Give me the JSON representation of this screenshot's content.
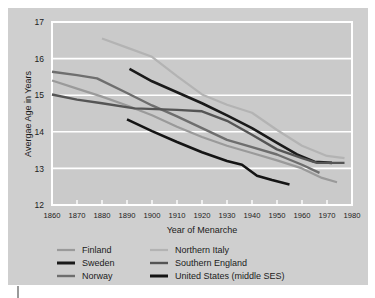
{
  "chart_data": {
    "type": "line",
    "title": "",
    "xlabel": "Year of Menarche",
    "ylabel": "Avergae Age in Years",
    "xlim": [
      1860,
      1980
    ],
    "ylim": [
      12,
      17
    ],
    "xticks": [
      1860,
      1870,
      1880,
      1890,
      1900,
      1910,
      1920,
      1930,
      1940,
      1950,
      1960,
      1970,
      1980
    ],
    "yticks": [
      12,
      13,
      14,
      15,
      16,
      17
    ],
    "xtick_labels": [
      "1860",
      "1870",
      "1880",
      "1890",
      "1900",
      "1910",
      "1920",
      "1930",
      "1940",
      "1950",
      "1960",
      "1970",
      "1980"
    ],
    "ytick_labels": [
      "12",
      "13",
      "14",
      "15",
      "16",
      "17"
    ],
    "grid": true,
    "legend_position": "below",
    "background_color": "#cfcfcf",
    "gridline_color": "#ffffff",
    "series": [
      {
        "name": "Finland",
        "color": "#9a9a9a",
        "width": 2.2,
        "points": [
          [
            1860,
            15.4
          ],
          [
            1870,
            15.18
          ],
          [
            1880,
            14.96
          ],
          [
            1890,
            14.72
          ],
          [
            1900,
            14.45
          ],
          [
            1910,
            14.14
          ],
          [
            1920,
            13.86
          ],
          [
            1930,
            13.62
          ],
          [
            1940,
            13.42
          ],
          [
            1950,
            13.22
          ],
          [
            1960,
            13.0
          ],
          [
            1968,
            12.74
          ],
          [
            1974,
            12.62
          ]
        ]
      },
      {
        "name": "Sweden",
        "color": "#1a1a1a",
        "width": 2.6,
        "points": [
          [
            1891,
            15.72
          ],
          [
            1900,
            15.38
          ],
          [
            1910,
            15.08
          ],
          [
            1920,
            14.78
          ],
          [
            1930,
            14.45
          ],
          [
            1940,
            14.1
          ],
          [
            1950,
            13.7
          ],
          [
            1958,
            13.38
          ],
          [
            1965,
            13.18
          ],
          [
            1972,
            13.15
          ]
        ]
      },
      {
        "name": "Norway",
        "color": "#6e6e6e",
        "width": 2.4,
        "points": [
          [
            1860,
            15.64
          ],
          [
            1870,
            15.55
          ],
          [
            1878,
            15.46
          ],
          [
            1890,
            15.06
          ],
          [
            1900,
            14.72
          ],
          [
            1910,
            14.42
          ],
          [
            1920,
            14.1
          ],
          [
            1930,
            13.78
          ],
          [
            1940,
            13.58
          ],
          [
            1950,
            13.38
          ],
          [
            1960,
            13.1
          ],
          [
            1967,
            12.88
          ]
        ]
      },
      {
        "name": "Northern Italy",
        "color": "#b3b3b3",
        "width": 2.2,
        "points": [
          [
            1880,
            16.55
          ],
          [
            1890,
            16.3
          ],
          [
            1900,
            16.05
          ],
          [
            1910,
            15.52
          ],
          [
            1920,
            15.02
          ],
          [
            1930,
            14.74
          ],
          [
            1940,
            14.52
          ],
          [
            1950,
            14.05
          ],
          [
            1960,
            13.62
          ],
          [
            1970,
            13.34
          ],
          [
            1977,
            13.28
          ]
        ]
      },
      {
        "name": "Southern England",
        "color": "#555555",
        "width": 2.4,
        "points": [
          [
            1860,
            15.02
          ],
          [
            1870,
            14.88
          ],
          [
            1880,
            14.78
          ],
          [
            1893,
            14.64
          ],
          [
            1910,
            14.6
          ],
          [
            1920,
            14.56
          ],
          [
            1930,
            14.3
          ],
          [
            1940,
            13.92
          ],
          [
            1950,
            13.52
          ],
          [
            1960,
            13.28
          ],
          [
            1966,
            13.15
          ],
          [
            1977,
            13.15
          ]
        ]
      },
      {
        "name": "United States (middle SES)",
        "color": "#141414",
        "width": 2.6,
        "points": [
          [
            1890,
            14.34
          ],
          [
            1900,
            14.02
          ],
          [
            1910,
            13.72
          ],
          [
            1920,
            13.44
          ],
          [
            1930,
            13.2
          ],
          [
            1936,
            13.1
          ],
          [
            1942,
            12.8
          ],
          [
            1948,
            12.68
          ],
          [
            1955,
            12.56
          ]
        ]
      }
    ],
    "legend": [
      {
        "label": "Finland",
        "color": "#9a9a9a",
        "width": 2.2,
        "column": 0,
        "row": 0
      },
      {
        "label": "Sweden",
        "color": "#1a1a1a",
        "width": 3.0,
        "column": 0,
        "row": 1
      },
      {
        "label": "Norway",
        "color": "#6e6e6e",
        "width": 2.4,
        "column": 0,
        "row": 2
      },
      {
        "label": "Northern Italy",
        "color": "#b3b3b3",
        "width": 2.2,
        "column": 1,
        "row": 0
      },
      {
        "label": "Southern England",
        "color": "#555555",
        "width": 2.4,
        "column": 1,
        "row": 1
      },
      {
        "label": "United States (middle SES)",
        "color": "#141414",
        "width": 3.0,
        "column": 1,
        "row": 2
      }
    ]
  }
}
